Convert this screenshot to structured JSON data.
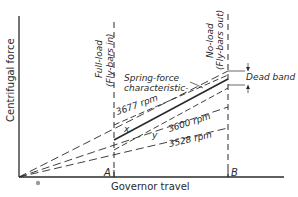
{
  "diagram": {
    "axes": {
      "y_label": "Centrifugal force",
      "x_label": "Governor travel"
    },
    "markers": {
      "a": "A",
      "b": "B",
      "x": "x",
      "y": "y"
    },
    "vertical_lines": {
      "full_load": {
        "line1": "Full-load",
        "line2": "(Fly-bars in)"
      },
      "no_load": {
        "line1": "No-load",
        "line2": "(Fly-bars out)"
      }
    },
    "annotations": {
      "spring_force_line1": "Spring-force",
      "spring_force_line2": "characteristic-",
      "dead_band": "Dead band"
    },
    "speed_lines": [
      {
        "label": "3677 rpm"
      },
      {
        "label": "3600 rpm"
      },
      {
        "label": "3528 rpm"
      }
    ],
    "colors": {
      "ink": "#2a2a2a",
      "background": "#ffffff",
      "dot": "#9a9a9a"
    }
  }
}
